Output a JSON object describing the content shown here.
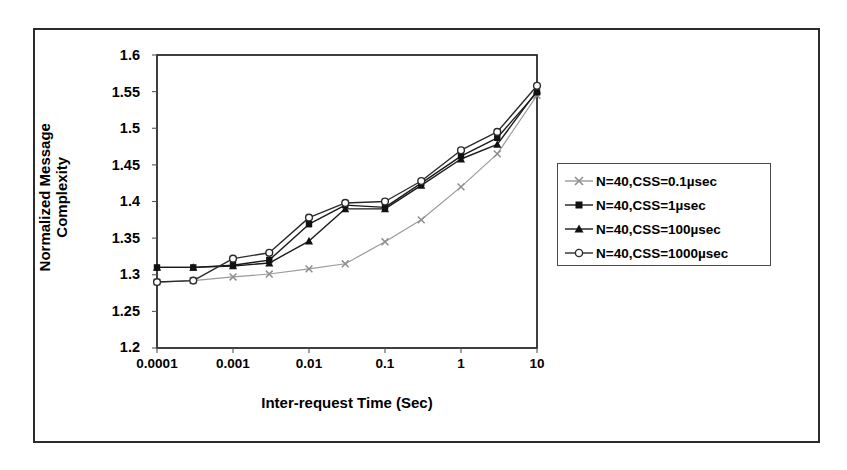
{
  "chart_data": {
    "type": "line",
    "title": "",
    "xlabel": "Inter-request Time (Sec)",
    "ylabel": "Normalized Message Complexity",
    "ylabel_line1": "Normalized Message",
    "ylabel_line2": "Complexity",
    "xscale": "log",
    "xlim": [
      0.0001,
      10
    ],
    "ylim": [
      1.2,
      1.6
    ],
    "yticks": [
      "1.2",
      "1.25",
      "1.3",
      "1.35",
      "1.4",
      "1.45",
      "1.5",
      "1.55",
      "1.6"
    ],
    "ytick_values": [
      1.2,
      1.25,
      1.3,
      1.35,
      1.4,
      1.45,
      1.5,
      1.55,
      1.6
    ],
    "xticks": [
      "0.0001",
      "0.001",
      "0.01",
      "0.1",
      "1",
      "10"
    ],
    "xtick_values": [
      0.0001,
      0.001,
      0.01,
      0.1,
      1,
      10
    ],
    "grid": false,
    "legend_position": "right-outside",
    "x": [
      0.0001,
      0.0003,
      0.001,
      0.003,
      0.01,
      0.03,
      0.1,
      0.3,
      1,
      3,
      10
    ],
    "series": [
      {
        "name": "N=40,CSS=0.1µsec",
        "marker": "x",
        "color": "#9a9a9a",
        "values": [
          1.29,
          1.292,
          1.297,
          1.301,
          1.308,
          1.315,
          1.345,
          1.375,
          1.42,
          1.465,
          1.545
        ]
      },
      {
        "name": "N=40,CSS=1µsec",
        "marker": "square-filled",
        "color": "#1a1a1a",
        "values": [
          1.31,
          1.31,
          1.313,
          1.32,
          1.369,
          1.395,
          1.392,
          1.425,
          1.462,
          1.487,
          1.549
        ]
      },
      {
        "name": "N=40,CSS=100µsec",
        "marker": "triangle-filled",
        "color": "#1a1a1a",
        "values": [
          1.31,
          1.31,
          1.312,
          1.316,
          1.346,
          1.39,
          1.39,
          1.422,
          1.458,
          1.478,
          1.551
        ]
      },
      {
        "name": "N=40,CSS=1000µsec",
        "marker": "circle-open",
        "color": "#2b2b2b",
        "values": [
          1.29,
          1.292,
          1.322,
          1.33,
          1.378,
          1.398,
          1.4,
          1.428,
          1.47,
          1.495,
          1.558
        ]
      }
    ]
  },
  "legend": {
    "items": [
      {
        "label": "N=40,CSS=0.1µsec"
      },
      {
        "label": "N=40,CSS=1µsec"
      },
      {
        "label": "N=40,CSS=100µsec"
      },
      {
        "label": "N=40,CSS=1000µsec"
      }
    ]
  },
  "colors": {
    "axis": "#2b2b2b",
    "frame": "#2b2b2b",
    "series_light": "#9a9a9a",
    "series_dark": "#1a1a1a",
    "background": "#ffffff"
  }
}
